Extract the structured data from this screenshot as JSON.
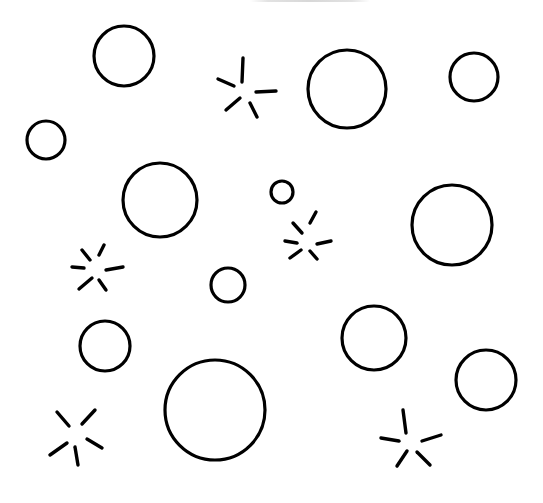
{
  "illustration": {
    "description": "Hand-drawn black outline circles and sparkle marks on white background",
    "background_color": "#ffffff",
    "ink_color": "#000000",
    "caption_clipped": true,
    "circles": [
      {
        "id": "circle-1",
        "cx": 124,
        "cy": 56,
        "r": 30
      },
      {
        "id": "circle-2",
        "cx": 347,
        "cy": 89,
        "r": 39
      },
      {
        "id": "circle-3",
        "cx": 474,
        "cy": 77,
        "r": 24
      },
      {
        "id": "circle-4",
        "cx": 46,
        "cy": 140,
        "r": 19
      },
      {
        "id": "circle-5",
        "cx": 160,
        "cy": 200,
        "r": 37
      },
      {
        "id": "circle-6",
        "cx": 282,
        "cy": 192,
        "r": 11
      },
      {
        "id": "circle-7",
        "cx": 452,
        "cy": 225,
        "r": 40
      },
      {
        "id": "circle-8",
        "cx": 228,
        "cy": 285,
        "r": 17
      },
      {
        "id": "circle-9",
        "cx": 374,
        "cy": 338,
        "r": 32
      },
      {
        "id": "circle-10",
        "cx": 105,
        "cy": 346,
        "r": 25
      },
      {
        "id": "circle-11",
        "cx": 215,
        "cy": 410,
        "r": 50
      },
      {
        "id": "circle-12",
        "cx": 486,
        "cy": 380,
        "r": 30
      }
    ],
    "sparkles": [
      {
        "id": "sparkle-1",
        "strokes": [
          [
            243,
            58,
            242,
            82
          ],
          [
            218,
            79,
            234,
            86
          ],
          [
            256,
            92,
            276,
            91
          ],
          [
            226,
            110,
            240,
            98
          ],
          [
            250,
            103,
            257,
            117
          ]
        ]
      },
      {
        "id": "sparkle-2",
        "strokes": [
          [
            293,
            223,
            302,
            233
          ],
          [
            310,
            223,
            316,
            212
          ],
          [
            285,
            241,
            297,
            243
          ],
          [
            317,
            244,
            331,
            241
          ],
          [
            290,
            258,
            301,
            250
          ],
          [
            310,
            251,
            317,
            259
          ]
        ]
      },
      {
        "id": "sparkle-3",
        "strokes": [
          [
            82,
            250,
            90,
            260
          ],
          [
            99,
            255,
            104,
            245
          ],
          [
            72,
            267,
            84,
            268
          ],
          [
            106,
            270,
            123,
            267
          ],
          [
            79,
            289,
            92,
            278
          ],
          [
            99,
            280,
            106,
            290
          ]
        ]
      },
      {
        "id": "sparkle-4",
        "strokes": [
          [
            57,
            412,
            69,
            426
          ],
          [
            82,
            424,
            95,
            410
          ],
          [
            50,
            455,
            67,
            443
          ],
          [
            75,
            447,
            78,
            465
          ],
          [
            87,
            439,
            102,
            448
          ]
        ]
      },
      {
        "id": "sparkle-5",
        "strokes": [
          [
            403,
            410,
            406,
            433
          ],
          [
            381,
            438,
            399,
            441
          ],
          [
            422,
            441,
            441,
            435
          ],
          [
            397,
            466,
            407,
            451
          ],
          [
            417,
            452,
            430,
            465
          ]
        ]
      }
    ]
  }
}
